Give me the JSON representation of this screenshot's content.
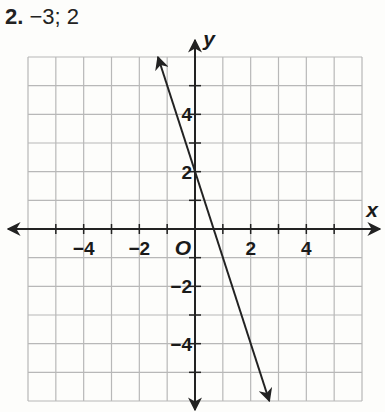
{
  "problem": {
    "number": "2.",
    "text": "−3; 2"
  },
  "chart_data": {
    "type": "line",
    "title": "2. −3; 2",
    "xlabel": "x",
    "ylabel": "y",
    "origin_label": "O",
    "xlim": [
      -6,
      6
    ],
    "ylim": [
      -6,
      6
    ],
    "grid": true,
    "x_tick_labels": [
      "−4",
      "−2",
      "2",
      "4"
    ],
    "y_tick_labels": [
      "4",
      "2",
      "−2",
      "−4"
    ],
    "series": [
      {
        "name": "y = -3x + 2",
        "slope": -3,
        "y_intercept": 2,
        "x": [
          -1.33,
          2.67
        ],
        "y": [
          6,
          -6
        ],
        "arrows": "both"
      }
    ]
  }
}
